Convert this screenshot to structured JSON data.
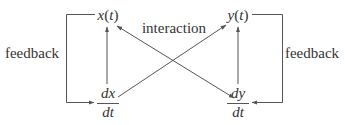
{
  "diagram": {
    "nodes": {
      "x_t": {
        "var": "x",
        "open": "(",
        "arg": "t",
        "close": ")"
      },
      "y_t": {
        "var": "y",
        "open": "(",
        "arg": "t",
        "close": ")"
      },
      "dx_dt": {
        "numerator": "dx",
        "denominator": "dt"
      },
      "dy_dt": {
        "numerator": "dy",
        "denominator": "dt"
      }
    },
    "labels": {
      "interaction": "interaction",
      "feedback_left": "feedback",
      "feedback_right": "feedback"
    },
    "edges": [
      {
        "from": "dx/dt",
        "to": "x(t)",
        "type": "arrow"
      },
      {
        "from": "dy/dt",
        "to": "y(t)",
        "type": "arrow"
      },
      {
        "from": "x(t)",
        "to": "dx/dt",
        "type": "feedback"
      },
      {
        "from": "y(t)",
        "to": "dy/dt",
        "type": "feedback"
      },
      {
        "from": "x(t)",
        "to": "dy/dt",
        "type": "interaction"
      },
      {
        "from": "y(t)",
        "to": "dx/dt",
        "type": "interaction"
      }
    ],
    "colors": {
      "line": "#555555",
      "text": "#333333",
      "background": "#ffffff"
    }
  }
}
